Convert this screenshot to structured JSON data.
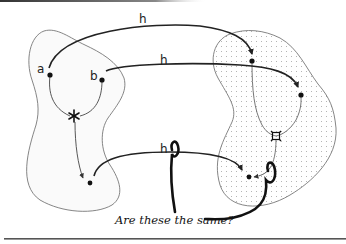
{
  "diagram": {
    "left_region": {
      "points": [
        {
          "id": "a",
          "label": "a"
        },
        {
          "id": "b",
          "label": "b"
        },
        {
          "id": "star",
          "label": "*"
        },
        {
          "id": "c",
          "label": ""
        }
      ]
    },
    "right_region": {
      "fill": "dotted",
      "points": [
        {
          "id": "h_a",
          "label": ""
        },
        {
          "id": "h_b",
          "label": ""
        },
        {
          "id": "quad",
          "label": "¤"
        },
        {
          "id": "h_c",
          "label": ""
        }
      ]
    },
    "arrows": [
      {
        "from": "a",
        "to": "h_a",
        "label": "h"
      },
      {
        "from": "b",
        "to": "h_b",
        "label": "h"
      },
      {
        "from": "c",
        "to": "h_c",
        "label": "h"
      },
      {
        "from": "star",
        "to": "c",
        "label": ""
      },
      {
        "from": "quad",
        "to": "h_c",
        "label": ""
      }
    ],
    "question": "Are these the same?",
    "colors": {
      "line": "#222222",
      "outline": "#777777",
      "dots": "#b0b0b0"
    }
  }
}
